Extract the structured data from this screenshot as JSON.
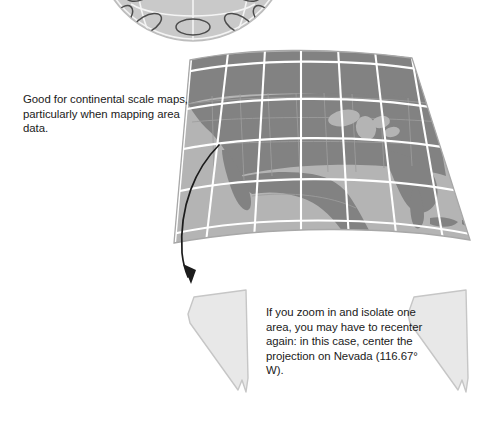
{
  "figure": {
    "background_color": "#ffffff",
    "captions": {
      "continental": "Good for continental scale maps, particularly when mapping area data.",
      "recenter": "If you zoom in and isolate one area, you may have to recenter again: in this case, center the projection on Nevada (116.67° W)."
    },
    "graphics": {
      "globe": {
        "name": "globe-with-tissot-ellipses",
        "description": "azimuthal globe cropped at top edge of image showing distortion ellipses",
        "ocean_color": "#c9c9c9",
        "land_color": "#9a9a9a",
        "graticule_color": "#f2f2f2",
        "ellipse_stroke": "#4a4a4a"
      },
      "conic_map": {
        "name": "conic-projection-north-america",
        "description": "conic projection of North America as a curved trapezoid with graticule",
        "ocean_color": "#b4b4b4",
        "land_color": "#828282",
        "graticule_color": "#ffffff",
        "border_color": "#a5a5a5"
      },
      "arrow": {
        "name": "curved-arrow",
        "color": "#1a1a1a",
        "direction": "from map down-left to Nevada outline"
      },
      "nevada_left": {
        "name": "nevada-outline-left",
        "fill_color": "#e8e8e8",
        "stroke_color": "#c4c4c4"
      },
      "nevada_right": {
        "name": "nevada-outline-right",
        "fill_color": "#e8e8e8",
        "stroke_color": "#c4c4c4"
      }
    }
  }
}
